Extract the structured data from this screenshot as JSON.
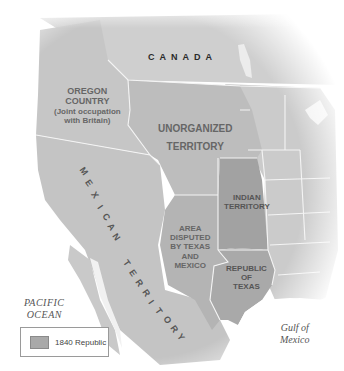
{
  "map": {
    "regions": [
      {
        "id": "canada",
        "label": "CANADA"
      },
      {
        "id": "oregon_country",
        "label_lines": [
          "OREGON",
          "COUNTRY"
        ],
        "sub_lines": [
          "(Joint occupation",
          "with Britain)"
        ]
      },
      {
        "id": "unorganized_territory",
        "label_lines": [
          "UNORGANIZED",
          "TERRITORY"
        ]
      },
      {
        "id": "indian_territory",
        "label_lines": [
          "INDIAN",
          "TERRITORY"
        ]
      },
      {
        "id": "disputed_area",
        "label_lines": [
          "AREA",
          "DISPUTED",
          "BY TEXAS",
          "AND",
          "MEXICO"
        ]
      },
      {
        "id": "republic_of_texas",
        "label_lines": [
          "REPUBLIC",
          "OF",
          "TEXAS"
        ]
      },
      {
        "id": "mexican_territory",
        "label_letters": [
          "M",
          "E",
          "X",
          "I",
          "C",
          "A",
          "N",
          " ",
          "T",
          "E",
          "R",
          "R",
          "I",
          "T",
          "O",
          "R",
          "Y"
        ]
      }
    ],
    "water": {
      "pacific": [
        "PACIFIC",
        "OCEAN"
      ],
      "gulf": [
        "Gulf of",
        "Mexico"
      ]
    },
    "colors": {
      "land": "#c9c9c9",
      "unorganized": "#bdbdbd",
      "mexican": "#c2c2c2",
      "republic": "#a9a9a9",
      "indian": "#a2a2a2",
      "border": "#f4f4f4",
      "water": "#ffffff"
    }
  },
  "legend": {
    "label": "1840 Republic",
    "swatch_color": "#a9a9a9"
  }
}
